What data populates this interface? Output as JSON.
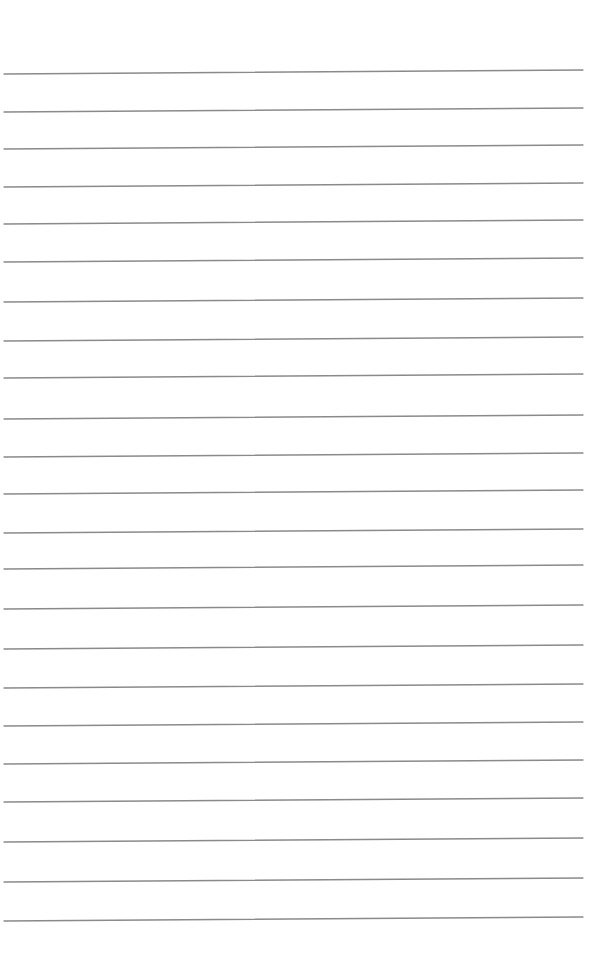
{
  "document": {
    "type": "lined-paper",
    "background_color": "#ffffff",
    "rule_color": "#8a8a8a",
    "line_count": 23,
    "line_start_x": 4,
    "line_end_x": 583,
    "right_end_offset_y": -4,
    "lines_left_y": [
      74,
      112,
      149,
      187,
      224,
      262,
      302,
      341,
      378,
      419,
      457,
      494,
      533,
      569,
      609,
      649,
      688,
      726,
      764,
      802,
      842,
      882,
      921
    ]
  }
}
